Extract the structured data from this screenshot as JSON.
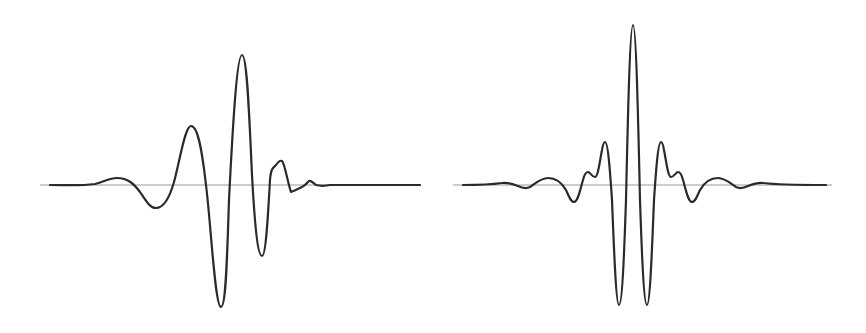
{
  "figure": {
    "panels": [
      {
        "id": "left",
        "description": "Asymmetric (minimum-phase-like) wavelet with trailing ripple",
        "baseline": {
          "x1": 40,
          "x2": 421,
          "y": 185
        },
        "baseline_color": "#9a9a9a",
        "curve_color": "#2a2a2a",
        "path": "M 50 185 C 65 185, 80 186, 95 184 C 103 182, 110 178, 117 178 C 128 178, 134 184, 140 192 C 146 201, 150 208, 156 208 C 164 208, 170 196, 174 182 C 180 160, 185 126, 191 126 C 198 126, 202 150, 206 185 C 211 225, 215 307, 221 307 C 226 307, 227 260, 229 200 C 233 120, 237 55, 242 55 C 247 55, 249 110, 252 175 C 255 230, 258 256, 262 256 C 266 256, 268 215, 270 180 C 271 168, 273 168, 276 165 C 278 162, 280 160, 282 161 C 285 164, 287 180, 291 192 C 294 191, 298 189, 302 187 C 305 186, 307 183, 309 181 C 311 180, 313 183, 316 185 C 320 186, 325 186, 330 185 C 360 185, 390 185, 420 185"
      },
      {
        "id": "right",
        "description": "Symmetric (zero-phase) wavelet",
        "baseline": {
          "x1": 453,
          "x2": 832,
          "y": 185
        },
        "baseline_color": "#9a9a9a",
        "curve_color": "#2a2a2a",
        "path": "M 463 185 C 475 185, 488 185, 502 183 C 508 182, 513 184, 518 186 C 522 188, 526 189, 530 187 C 536 183, 541 178, 548 178 C 557 178, 562 183, 566 190 C 569 197, 571 202, 574 202 C 578 202, 580 190, 583 180 C 584 176, 586 172, 588 172 C 590 172, 592 177, 595 177 C 598 177, 600 160, 602 150 C 603 144, 604 142, 605 142 C 608 142, 610 170, 612 200 C 614 250, 616 305, 619 305 C 622 305, 624 260, 626 200 C 628 110, 630 25, 633 25 C 636 25, 638 110, 640 200 C 642 260, 644 305, 647 305 C 650 305, 652 250, 654 200 C 656 170, 658 142, 661 142 C 662 142, 663 144, 664 150 C 666 160, 668 177, 671 177 C 674 177, 676 172, 678 172 C 680 172, 682 176, 683 180 C 686 190, 688 202, 692 202 C 695 202, 697 197, 700 190 C 704 183, 709 178, 718 178 C 725 178, 730 183, 736 187 C 740 189, 744 188, 748 186 C 753 184, 758 182, 764 183 C 778 185, 791 185, 826 185"
      }
    ]
  }
}
